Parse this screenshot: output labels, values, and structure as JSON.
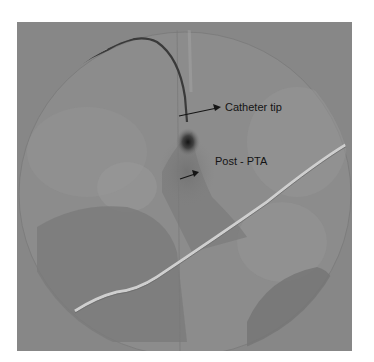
{
  "figure": {
    "type": "angiogram",
    "modality": "grayscale fluoroscopic angiography",
    "annotations": [
      {
        "id": "catheter-tip",
        "text": "Catheter tip"
      },
      {
        "id": "post-pta",
        "text": "Post - PTA"
      }
    ],
    "colors": {
      "background": "#ffffff",
      "image_field": "#8a8a8a",
      "field_circle": "#8e8e8e",
      "dark_vessel": "#2a2a2a",
      "wire": "#d8d8d8",
      "text": "#141414"
    }
  }
}
